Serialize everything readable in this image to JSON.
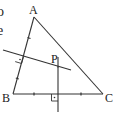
{
  "figure": {
    "type": "geometry-diagram",
    "points": {
      "A": {
        "label": "A",
        "x": 34,
        "y": 17
      },
      "B": {
        "label": "B",
        "x": 13,
        "y": 94
      },
      "C": {
        "label": "C",
        "x": 103,
        "y": 94
      },
      "P": {
        "label": "P",
        "x": 58,
        "y": 67
      }
    },
    "labels": {
      "A": "A",
      "B": "B",
      "C": "C",
      "P": "P"
    },
    "left_edge_fragments": [
      "o",
      "e"
    ],
    "colors": {
      "line": "#333333",
      "text": "#222222",
      "background": "#ffffff"
    }
  }
}
